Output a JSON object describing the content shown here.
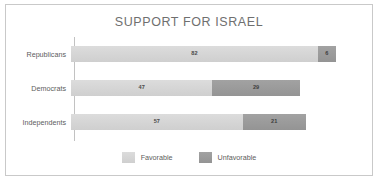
{
  "chart_data": {
    "type": "bar",
    "orientation": "horizontal",
    "stacked": true,
    "title": "SUPPORT FOR ISRAEL",
    "xlabel": "",
    "ylabel": "",
    "grid": false,
    "legend_position": "bottom-center",
    "xlim": [
      0,
      100
    ],
    "categories": [
      "Republicans",
      "Democrats",
      "Independents"
    ],
    "series": [
      {
        "name": "Favorable",
        "color": "#d4d4d4",
        "values": [
          82,
          47,
          57
        ]
      },
      {
        "name": "Unfavorable",
        "color": "#9a9a9a",
        "values": [
          6,
          29,
          21
        ]
      }
    ]
  },
  "legend": {
    "items": [
      {
        "label": "Favorable",
        "color": "#d4d4d4"
      },
      {
        "label": "Unfavorable",
        "color": "#9a9a9a"
      }
    ]
  }
}
